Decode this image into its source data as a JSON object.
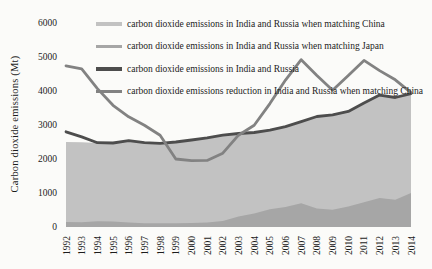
{
  "figure": {
    "background": "#fbfbf9",
    "text_color": "#1c1c1c"
  },
  "chart_data": {
    "type": "area",
    "title": "",
    "xlabel": "",
    "ylabel": "Carbon dioxide emissions (Mt)",
    "ylim": [
      0,
      6000
    ],
    "yticks": [
      0,
      1000,
      2000,
      3000,
      4000,
      5000,
      6000
    ],
    "grid": false,
    "legend_position": "top-left-inside",
    "x": [
      1992,
      1993,
      1994,
      1995,
      1996,
      1997,
      1998,
      1999,
      2000,
      2001,
      2002,
      2003,
      2004,
      2005,
      2006,
      2007,
      2008,
      2009,
      2010,
      2011,
      2012,
      2013,
      2014
    ],
    "series": [
      {
        "name": "carbon dioxide emissions in India and Russia when matching China",
        "style": "area",
        "color": "#c2c2c2",
        "values": [
          2500,
          2490,
          2470,
          2470,
          2540,
          2480,
          2460,
          2500,
          2560,
          2620,
          2700,
          2750,
          2780,
          2850,
          2950,
          3100,
          3250,
          3300,
          3400,
          3650,
          3880,
          3810,
          3920
        ]
      },
      {
        "name": "carbon dioxide emissions in India and Russia when matching Japan",
        "style": "area",
        "color": "#a6a6a6",
        "values": [
          150,
          140,
          170,
          160,
          130,
          110,
          110,
          110,
          120,
          130,
          180,
          310,
          400,
          520,
          590,
          700,
          545,
          510,
          600,
          730,
          850,
          800,
          1000
        ]
      },
      {
        "name": "carbon dioxide emissions in India and Russia",
        "style": "line",
        "color": "#4d4d4d",
        "values": [
          2800,
          2650,
          2480,
          2470,
          2540,
          2480,
          2460,
          2500,
          2560,
          2620,
          2700,
          2750,
          2780,
          2850,
          2950,
          3100,
          3250,
          3300,
          3400,
          3650,
          3880,
          3810,
          3920
        ]
      },
      {
        "name": "carbon dioxide emissions reduction in India and Russia when matching China",
        "style": "line",
        "color": "#828282",
        "values": [
          4740,
          4650,
          4070,
          3580,
          3240,
          2990,
          2700,
          2000,
          1950,
          1960,
          2170,
          2700,
          2990,
          3630,
          4320,
          4920,
          4460,
          4020,
          4460,
          4900,
          4600,
          4330,
          3950
        ]
      }
    ]
  }
}
